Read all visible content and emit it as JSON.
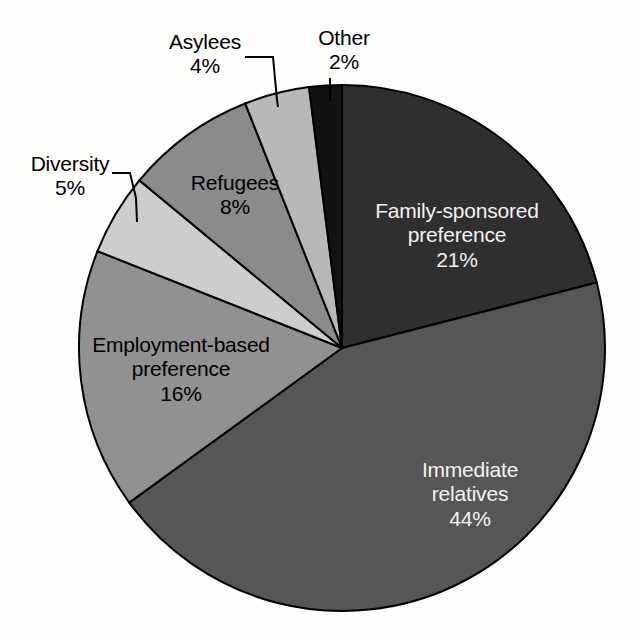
{
  "chart_data": {
    "type": "pie",
    "title": "",
    "subtitle": "",
    "legend_position": "none",
    "grid": false,
    "start_angle_deg": 0,
    "direction": "clockwise",
    "unit": "%",
    "categories": [
      "Family-sponsored preference",
      "Immediate relatives",
      "Employment-based preference",
      "Diversity",
      "Refugees",
      "Asylees",
      "Other"
    ],
    "values": [
      21,
      44,
      16,
      5,
      8,
      4,
      2
    ],
    "slices": [
      {
        "key": "family",
        "label": "Family-sponsored",
        "label_line2": "preference",
        "value_text": "21%",
        "value": 21,
        "color": "#2f2f2f",
        "label_placement": "inside",
        "start_deg": 0,
        "end_deg": 75.6
      },
      {
        "key": "immediate",
        "label": "Immediate",
        "label_line2": "relatives",
        "value_text": "44%",
        "value": 44,
        "color": "#565656",
        "label_placement": "inside",
        "start_deg": 75.6,
        "end_deg": 234.0
      },
      {
        "key": "employment",
        "label": "Employment-based",
        "label_line2": "preference",
        "value_text": "16%",
        "value": 16,
        "color": "#919191",
        "label_placement": "inside-dark-text",
        "start_deg": 234.0,
        "end_deg": 291.6
      },
      {
        "key": "diversity",
        "label": "Diversity",
        "label_line2": "",
        "value_text": "5%",
        "value": 5,
        "color": "#cdcdcd",
        "label_placement": "outside",
        "start_deg": 291.6,
        "end_deg": 309.6
      },
      {
        "key": "refugees",
        "label": "Refugees",
        "label_line2": "",
        "value_text": "8%",
        "value": 8,
        "color": "#8b8b8b",
        "label_placement": "inside-dark-text",
        "start_deg": 309.6,
        "end_deg": 338.4
      },
      {
        "key": "asylees",
        "label": "Asylees",
        "label_line2": "",
        "value_text": "4%",
        "value": 4,
        "color": "#b8b8b8",
        "label_placement": "outside",
        "start_deg": 338.4,
        "end_deg": 352.8
      },
      {
        "key": "other",
        "label": "Other",
        "label_line2": "",
        "value_text": "2%",
        "value": 2,
        "color": "#121212",
        "label_placement": "outside",
        "start_deg": 352.8,
        "end_deg": 360.0
      }
    ],
    "xlabel": "",
    "ylabel": ""
  },
  "colors": {
    "background": "#fdfdfb",
    "outline": "#000000",
    "inside_label_text": "#f2f2f2",
    "outside_label_text": "#000000"
  }
}
